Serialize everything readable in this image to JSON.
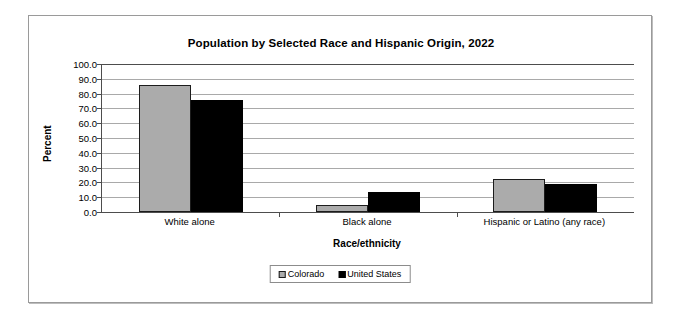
{
  "chart_data": {
    "type": "bar",
    "title": "Population by Selected Race and Hispanic Origin, 2022",
    "xlabel": "Race/ethnicity",
    "ylabel": "Percent",
    "categories": [
      "White alone",
      "Black alone",
      "Hispanic or Latino (any race)"
    ],
    "series": [
      {
        "name": "Colorado",
        "color": "#ababab",
        "values": [
          86.0,
          4.6,
          22.3
        ]
      },
      {
        "name": "United States",
        "color": "#000000",
        "values": [
          75.5,
          13.6,
          19.1
        ]
      }
    ],
    "ylim": [
      0,
      100
    ],
    "ytick_labels": [
      "100.0",
      "90.0",
      "80.0",
      "70.0",
      "60.0",
      "50.0",
      "40.0",
      "30.0",
      "20.0",
      "10.0",
      "0.0"
    ],
    "ytick_values": [
      100,
      90,
      80,
      70,
      60,
      50,
      40,
      30,
      20,
      10,
      0
    ],
    "grid": true,
    "legend_position": "bottom"
  },
  "colors": {
    "colorado": "#ababab",
    "united_states": "#000000",
    "gridline": "#a9a9a9",
    "axis": "#4d4d4d",
    "frame": "#9a9a9a"
  }
}
